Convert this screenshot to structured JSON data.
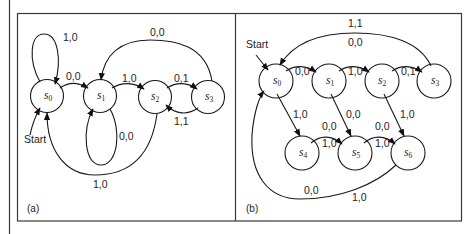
{
  "figure": {
    "panels": [
      {
        "id": "a",
        "caption": "(a)",
        "start_label": "Start",
        "states": [
          {
            "id": "s0",
            "name": "s",
            "sub": "0"
          },
          {
            "id": "s1",
            "name": "s",
            "sub": "1"
          },
          {
            "id": "s2",
            "name": "s",
            "sub": "2"
          },
          {
            "id": "s3",
            "name": "s",
            "sub": "3"
          }
        ],
        "transitions": [
          {
            "from": "s0",
            "to": "s0",
            "label": "1,0"
          },
          {
            "from": "s0",
            "to": "s1",
            "label": "0,0"
          },
          {
            "from": "s1",
            "to": "s1",
            "label": "0,0"
          },
          {
            "from": "s1",
            "to": "s2",
            "label": "1,0"
          },
          {
            "from": "s2",
            "to": "s3",
            "label": "0,1"
          },
          {
            "from": "s3",
            "to": "s2",
            "label": "1,1"
          },
          {
            "from": "s3",
            "to": "s1",
            "label": "0,0"
          },
          {
            "from": "s2",
            "to": "s0",
            "label": "1,0"
          }
        ]
      },
      {
        "id": "b",
        "caption": "(b)",
        "start_label": "Start",
        "states": [
          {
            "id": "s0",
            "name": "s",
            "sub": "0"
          },
          {
            "id": "s1",
            "name": "s",
            "sub": "1"
          },
          {
            "id": "s2",
            "name": "s",
            "sub": "2"
          },
          {
            "id": "s3",
            "name": "s",
            "sub": "3"
          },
          {
            "id": "s4",
            "name": "s",
            "sub": "4"
          },
          {
            "id": "s5",
            "name": "s",
            "sub": "5"
          },
          {
            "id": "s6",
            "name": "s",
            "sub": "6"
          }
        ],
        "transitions": [
          {
            "from": "s0",
            "to": "s1",
            "label": "0,0"
          },
          {
            "from": "s1",
            "to": "s2",
            "label": "1,0"
          },
          {
            "from": "s2",
            "to": "s3",
            "label": "0,1"
          },
          {
            "from": "s3",
            "to": "s0",
            "label": "1,1 / 0,0",
            "label_top": "1,1",
            "label_bottom": "0,0"
          },
          {
            "from": "s0",
            "to": "s4",
            "label": "1,0"
          },
          {
            "from": "s1",
            "to": "s5",
            "label": "0,0"
          },
          {
            "from": "s2",
            "to": "s6",
            "label": "1,0"
          },
          {
            "from": "s4",
            "to": "s5",
            "label": "0,0 / 1,0",
            "label_top": "0,0",
            "label_bottom": "1,0"
          },
          {
            "from": "s5",
            "to": "s6",
            "label": "0,0 / 1,0",
            "label_top": "0,0",
            "label_bottom": "1,0"
          },
          {
            "from": "s6",
            "to": "s0",
            "label": "0,0 / 1,0",
            "label_left": "0,0",
            "label_right": "1,0"
          }
        ]
      }
    ]
  }
}
